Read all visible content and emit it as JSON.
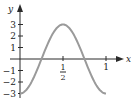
{
  "chart_data": {
    "type": "line",
    "title": "",
    "xlabel": "x",
    "ylabel": "y",
    "function": "y = -3cos(2πx)",
    "xlim": [
      0,
      1
    ],
    "ylim": [
      -3,
      3
    ],
    "grid": false,
    "x_ticks": [
      {
        "value": 0.5,
        "label_num": "1",
        "label_den": "2"
      },
      {
        "value": 1,
        "label": "1"
      }
    ],
    "y_ticks": [
      {
        "value": 3,
        "label": "3"
      },
      {
        "value": 2,
        "label": "2"
      },
      {
        "value": 1,
        "label": "1"
      },
      {
        "value": -1,
        "label": "−1"
      },
      {
        "value": -2,
        "label": "−2"
      },
      {
        "value": -3,
        "label": "−3"
      }
    ],
    "series": [
      {
        "name": "curve",
        "color": "#9a9a9a",
        "x": [
          0,
          0.125,
          0.25,
          0.375,
          0.5,
          0.625,
          0.75,
          0.875,
          1
        ],
        "y": [
          -3,
          -2.12,
          0,
          2.12,
          3,
          2.12,
          0,
          -2.12,
          -3
        ]
      }
    ]
  }
}
